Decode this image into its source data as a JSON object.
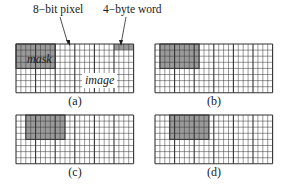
{
  "annotations": {
    "pixel_label": "8−bit pixel",
    "word_label": "4−byte word"
  },
  "grid": {
    "rows": 8,
    "cols": 24,
    "word_size": 4,
    "cell_w": 4.9,
    "cell_h": 6.1,
    "mask_color": "#9a9a9a",
    "line_color": "#333333"
  },
  "panels": [
    {
      "id": "a",
      "caption": "(a)",
      "x": 16,
      "y": 44,
      "mask_col_start": 0,
      "mask_cols": 8,
      "mask_rows": 4,
      "mask_label": "mask",
      "image_label": "image",
      "extra_word_shaded": {
        "col": 20,
        "row": 0
      }
    },
    {
      "id": "b",
      "caption": "(b)",
      "x": 155,
      "y": 44,
      "mask_col_start": 1,
      "mask_cols": 8,
      "mask_rows": 4
    },
    {
      "id": "c",
      "caption": "(c)",
      "x": 16,
      "y": 115,
      "mask_col_start": 2,
      "mask_cols": 8,
      "mask_rows": 4
    },
    {
      "id": "d",
      "caption": "(d)",
      "x": 155,
      "y": 115,
      "mask_col_start": 3,
      "mask_cols": 8,
      "mask_rows": 4
    }
  ]
}
